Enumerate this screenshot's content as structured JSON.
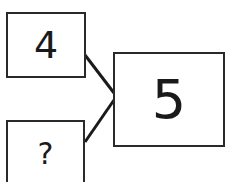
{
  "diagram": {
    "type": "number-bond",
    "parts": [
      {
        "label": "4"
      },
      {
        "label": "?"
      }
    ],
    "whole": {
      "label": "5"
    },
    "colors": {
      "stroke": "#2a2a2a",
      "text": "#1a1a1a",
      "background": "#ffffff"
    }
  }
}
